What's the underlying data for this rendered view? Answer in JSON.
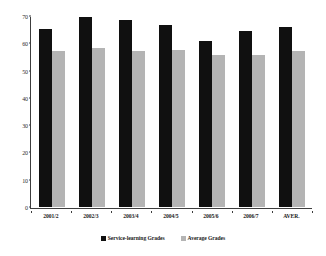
{
  "chart_data": {
    "type": "bar",
    "title": "",
    "subtitle": "",
    "xlabel": "",
    "ylabel": "",
    "ylim": [
      0,
      70
    ],
    "yticks": [
      0,
      10,
      20,
      30,
      40,
      50,
      60,
      70
    ],
    "ytick_labels": [
      "0",
      "10",
      "20",
      "30",
      "40",
      "50",
      "60",
      "70"
    ],
    "grid": false,
    "legend_position": "bottom",
    "categories": [
      "2001/2",
      "2002/3",
      "2003/4",
      "2004/5",
      "2005/6",
      "2006/7",
      "AVER."
    ],
    "series": [
      {
        "name": "Service-learning Grades",
        "color": "#101010",
        "values": [
          65.5,
          70.0,
          69.0,
          67.0,
          61.0,
          65.0,
          66.5
        ]
      },
      {
        "name": "Average Grades",
        "color": "#b4b4b4",
        "values": [
          57.5,
          58.5,
          57.5,
          58.0,
          56.0,
          56.0,
          57.5
        ]
      }
    ]
  },
  "legend": {
    "items": [
      {
        "label": "Service-learning Grades",
        "color": "#101010"
      },
      {
        "label": "Average Grades",
        "color": "#b4b4b4"
      }
    ]
  },
  "axis": {
    "line_color": "#3d3d3d"
  }
}
